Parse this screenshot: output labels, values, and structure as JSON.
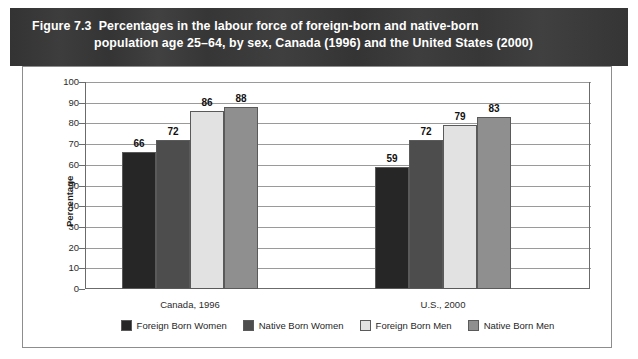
{
  "figure": {
    "number": "Figure 7.3",
    "title_line_1": "Percentages in the labour force of foreign-born and native-born",
    "title_line_2": "population age 25–64, by sex, Canada (1996) and the United States (2000)",
    "band_color": "#3a3a3a",
    "band_text_color": "#ffffff"
  },
  "chart_data": {
    "type": "bar",
    "title": "Percentages in the labour force of foreign-born and native-born population age 25–64, by sex, Canada (1996) and the United States (2000)",
    "xlabel": "",
    "ylabel": "Percentage",
    "ylim": [
      0,
      100
    ],
    "yticks": [
      0,
      10,
      20,
      30,
      40,
      50,
      60,
      70,
      80,
      90,
      100
    ],
    "ytick_labels": [
      "0",
      "10",
      "20",
      "30",
      "40",
      "50",
      "60",
      "70",
      "80",
      "90",
      "100"
    ],
    "grid": true,
    "legend_position": "bottom",
    "categories": [
      "Canada, 1996",
      "U.S., 2000"
    ],
    "series": [
      {
        "name": "Foreign Born Women",
        "color": "#262626",
        "values": [
          66,
          59
        ]
      },
      {
        "name": "Native Born Women",
        "color": "#4d4d4d",
        "values": [
          72,
          72
        ]
      },
      {
        "name": "Foreign Born Men",
        "color": "#e2e2e2",
        "values": [
          86,
          79
        ]
      },
      {
        "name": "Native Born Men",
        "color": "#8f8f8f",
        "values": [
          88,
          83
        ]
      }
    ],
    "data_labels": [
      {
        "group": "Canada, 1996",
        "series": "Foreign Born Women",
        "value": "66"
      },
      {
        "group": "Canada, 1996",
        "series": "Native Born Women",
        "value": "72"
      },
      {
        "group": "Canada, 1996",
        "series": "Foreign Born Men",
        "value": "86"
      },
      {
        "group": "Canada, 1996",
        "series": "Native Born Men",
        "value": "88"
      },
      {
        "group": "U.S., 2000",
        "series": "Foreign Born Women",
        "value": "59"
      },
      {
        "group": "U.S., 2000",
        "series": "Native Born Women",
        "value": "72"
      },
      {
        "group": "U.S., 2000",
        "series": "Foreign Born Men",
        "value": "79"
      },
      {
        "group": "U.S., 2000",
        "series": "Native Born Men",
        "value": "83"
      }
    ]
  }
}
